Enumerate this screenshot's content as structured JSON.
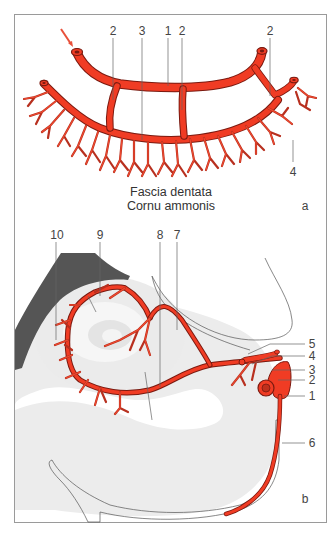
{
  "figure": {
    "frame": {
      "border_color": "#9a9a9a"
    },
    "colors": {
      "vessel": "#f03c24",
      "vessel_dark": "#7a1a10",
      "bone_gray": "#555555",
      "tissue_light_gray": "#ececec",
      "tissue_mid_gray": "#e2e2e2",
      "arrow": "#e8503a"
    },
    "panel_a": {
      "letter": "a",
      "caption_line1": "Fascia dentata",
      "caption_line2": "Cornu ammonis",
      "labels": [
        {
          "id": "a-2-left",
          "text": "2"
        },
        {
          "id": "a-3",
          "text": "3"
        },
        {
          "id": "a-1",
          "text": "1"
        },
        {
          "id": "a-2-mid",
          "text": "2"
        },
        {
          "id": "a-2-right",
          "text": "2"
        },
        {
          "id": "a-4",
          "text": "4"
        }
      ]
    },
    "panel_b": {
      "letter": "b",
      "labels": [
        {
          "id": "b-10",
          "text": "10"
        },
        {
          "id": "b-9",
          "text": "9"
        },
        {
          "id": "b-8",
          "text": "8"
        },
        {
          "id": "b-7",
          "text": "7"
        },
        {
          "id": "b-5",
          "text": "5"
        },
        {
          "id": "b-4",
          "text": "4"
        },
        {
          "id": "b-3",
          "text": "3"
        },
        {
          "id": "b-2",
          "text": "2"
        },
        {
          "id": "b-1",
          "text": "1"
        },
        {
          "id": "b-6",
          "text": "6"
        }
      ]
    }
  }
}
